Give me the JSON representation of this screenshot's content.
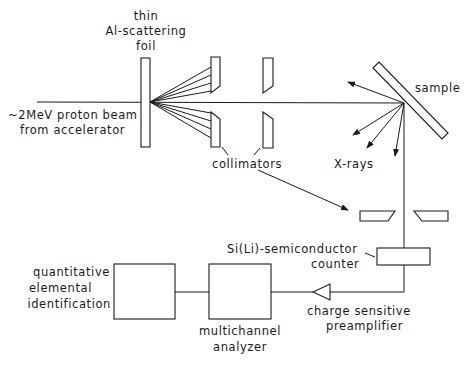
{
  "diagram": {
    "labels": {
      "foil": [
        "thin",
        "Al-scattering",
        "foil"
      ],
      "beam": [
        "~2MeV proton beam",
        "from accelerator"
      ],
      "sample": "sample",
      "xrays": "X-rays",
      "collimators": "collimators",
      "counter": [
        "Si(Li)-semiconductor",
        "counter"
      ],
      "preamp": [
        "charge sensitive",
        "preamplifier"
      ],
      "mca": [
        "multichannel",
        "analyzer"
      ],
      "identification": [
        "quantitative",
        "elemental",
        "identification"
      ]
    }
  }
}
